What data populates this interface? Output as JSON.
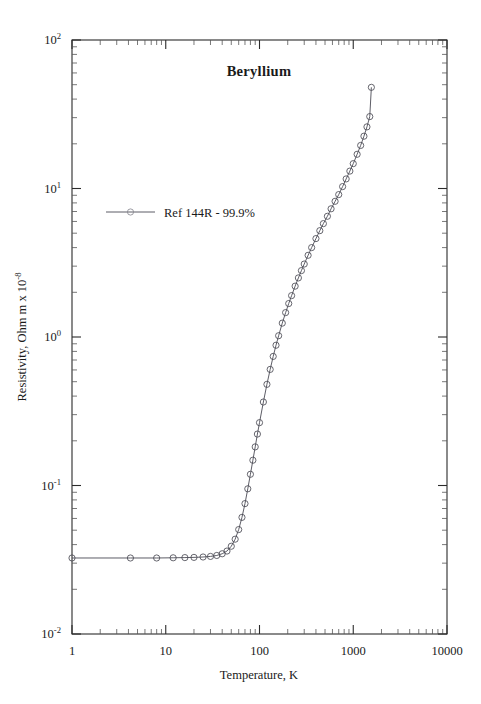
{
  "chart_data": {
    "type": "line",
    "title": "Beryllium",
    "xlabel": "Temperature,  K",
    "ylabel": "Resistivity, Ohm m x 10",
    "ylabel_exponent": "-8",
    "xscale": "log",
    "yscale": "log",
    "xlim": [
      1,
      10000
    ],
    "ylim": [
      0.01,
      100
    ],
    "grid": false,
    "legend_position": "upper-left-inside",
    "x_ticks": [
      {
        "value": 1,
        "label": "1"
      },
      {
        "value": 10,
        "label": "10"
      },
      {
        "value": 100,
        "label": "100"
      },
      {
        "value": 1000,
        "label": "1000"
      },
      {
        "value": 10000,
        "label": "10000"
      }
    ],
    "y_ticks": [
      {
        "value": 100,
        "mantissa": "10",
        "exponent": "2"
      },
      {
        "value": 10,
        "mantissa": "10",
        "exponent": "1"
      },
      {
        "value": 1,
        "mantissa": "10",
        "exponent": "0"
      },
      {
        "value": 0.1,
        "mantissa": "10",
        "exponent": "-1"
      },
      {
        "value": 0.01,
        "mantissa": "10",
        "exponent": "-2"
      }
    ],
    "series": [
      {
        "name": "Ref 144R - 99.9%",
        "marker": "open-circle",
        "line": "solid",
        "color": "#4b4b55",
        "x": [
          1,
          4.2,
          8,
          12,
          16,
          20,
          25,
          30,
          35,
          40,
          45,
          50,
          55,
          60,
          65,
          70,
          75,
          80,
          85,
          90,
          95,
          100,
          110,
          120,
          130,
          140,
          150,
          160,
          175,
          190,
          205,
          220,
          240,
          260,
          280,
          300,
          330,
          360,
          400,
          440,
          480,
          530,
          580,
          640,
          700,
          770,
          840,
          920,
          1000,
          1100,
          1200,
          1300,
          1400,
          1500,
          1560
        ],
        "y": [
          0.0325,
          0.0325,
          0.0325,
          0.0326,
          0.0327,
          0.0328,
          0.033,
          0.0333,
          0.0338,
          0.0347,
          0.0362,
          0.039,
          0.0435,
          0.0505,
          0.061,
          0.0755,
          0.095,
          0.119,
          0.148,
          0.182,
          0.222,
          0.265,
          0.365,
          0.48,
          0.605,
          0.74,
          0.88,
          1.02,
          1.24,
          1.46,
          1.68,
          1.9,
          2.2,
          2.5,
          2.8,
          3.1,
          3.55,
          4.0,
          4.6,
          5.2,
          5.8,
          6.5,
          7.3,
          8.2,
          9.1,
          10.3,
          11.6,
          13.1,
          14.7,
          17.0,
          19.5,
          22.5,
          26.0,
          30.5,
          48.0
        ]
      }
    ]
  },
  "legend": {
    "entries": [
      {
        "label": "Ref 144R - 99.9%"
      }
    ]
  }
}
